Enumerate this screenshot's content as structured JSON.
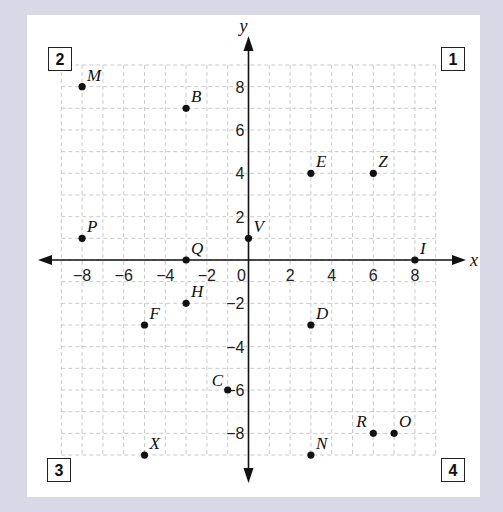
{
  "chart_data": {
    "type": "scatter",
    "title": "",
    "xlabel": "x",
    "ylabel": "y",
    "xlim": [
      -9,
      9
    ],
    "ylim": [
      -9,
      9
    ],
    "grid": true,
    "x_ticks": [
      "-8",
      "-6",
      "-4",
      "-2",
      "0",
      "2",
      "4",
      "6",
      "8"
    ],
    "y_ticks": [
      "8",
      "6",
      "4",
      "2",
      "-2",
      "-4",
      "-6",
      "-8"
    ],
    "points": [
      {
        "label": "M",
        "x": -8,
        "y": 8
      },
      {
        "label": "B",
        "x": -3,
        "y": 7
      },
      {
        "label": "P",
        "x": -8,
        "y": 1
      },
      {
        "label": "Q",
        "x": -3,
        "y": 0
      },
      {
        "label": "V",
        "x": 0,
        "y": 1
      },
      {
        "label": "E",
        "x": 3,
        "y": 4
      },
      {
        "label": "Z",
        "x": 6,
        "y": 4
      },
      {
        "label": "I",
        "x": 8,
        "y": 0
      },
      {
        "label": "H",
        "x": -3,
        "y": -2
      },
      {
        "label": "F",
        "x": -5,
        "y": -3
      },
      {
        "label": "D",
        "x": 3,
        "y": -3
      },
      {
        "label": "C",
        "x": -1,
        "y": -6
      },
      {
        "label": "X",
        "x": -5,
        "y": -9
      },
      {
        "label": "N",
        "x": 3,
        "y": -9
      },
      {
        "label": "R",
        "x": 6,
        "y": -8
      },
      {
        "label": "O",
        "x": 7,
        "y": -8
      }
    ],
    "quadrant_labels": [
      {
        "label": "1",
        "position": "top-right"
      },
      {
        "label": "2",
        "position": "top-left"
      },
      {
        "label": "3",
        "position": "bottom-left"
      },
      {
        "label": "4",
        "position": "bottom-right"
      }
    ]
  },
  "quadrants": {
    "q1": "1",
    "q2": "2",
    "q3": "3",
    "q4": "4"
  },
  "axes": {
    "x_label": "x",
    "y_label": "y"
  }
}
